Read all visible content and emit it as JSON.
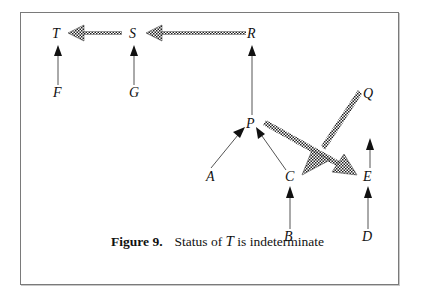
{
  "figure": {
    "number_label": "Figure 9.",
    "caption_prefix": "Status of ",
    "caption_var": "T",
    "caption_suffix": " is indeterminate"
  },
  "nodes": {
    "T": "T",
    "S": "S",
    "R": "R",
    "F": "F",
    "G": "G",
    "P": "P",
    "Q": "Q",
    "A": "A",
    "C": "C",
    "E": "E",
    "B": "B",
    "D": "D"
  },
  "edges": [
    {
      "from": "S",
      "to": "T",
      "style": "checkered"
    },
    {
      "from": "R",
      "to": "S",
      "style": "checkered"
    },
    {
      "from": "F",
      "to": "T",
      "style": "solid"
    },
    {
      "from": "G",
      "to": "S",
      "style": "solid"
    },
    {
      "from": "P",
      "to": "R",
      "style": "solid"
    },
    {
      "from": "A",
      "to": "P",
      "style": "solid"
    },
    {
      "from": "C",
      "to": "P",
      "style": "solid"
    },
    {
      "from": "P",
      "to": "E",
      "style": "checkered"
    },
    {
      "from": "Q",
      "to": "C",
      "style": "checkered"
    },
    {
      "from": "E",
      "to": "Q",
      "style": "solid"
    },
    {
      "from": "B",
      "to": "C",
      "style": "solid"
    },
    {
      "from": "D",
      "to": "E",
      "style": "solid"
    }
  ]
}
